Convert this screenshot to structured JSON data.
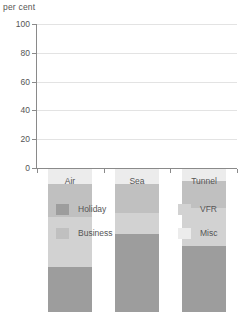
{
  "chart_data": {
    "type": "bar",
    "subtype": "stacked-bar",
    "title": "",
    "xlabel": "",
    "ylabel": "per cent",
    "ylim": [
      0,
      100
    ],
    "yticks": [
      0,
      20,
      40,
      60,
      80,
      100
    ],
    "grid": true,
    "legend_position": "bottom",
    "categories": [
      "Air",
      "Sea",
      "Tunnel"
    ],
    "series": [
      {
        "name": "Holiday",
        "color": "#9d9d9d",
        "values": [
          31,
          54,
          46
        ]
      },
      {
        "name": "VFR",
        "color": "#d2d2d2",
        "values": [
          35,
          15,
          26
        ]
      },
      {
        "name": "Business",
        "color": "#c0c0c0",
        "values": [
          23,
          20,
          19
        ]
      },
      {
        "name": "Misc",
        "color": "#ececec",
        "values": [
          11,
          11,
          9
        ]
      }
    ],
    "totals": [
      100,
      100,
      100
    ],
    "bar_tops": [
      89,
      89,
      91
    ]
  },
  "axis": {
    "y_title": "per cent",
    "y_ticks": [
      {
        "label": "100"
      },
      {
        "label": "80"
      },
      {
        "label": "60"
      },
      {
        "label": "40"
      },
      {
        "label": "20"
      },
      {
        "label": "0"
      }
    ],
    "x_ticks": [
      {
        "label": "Air"
      },
      {
        "label": "Sea"
      },
      {
        "label": "Tunnel"
      }
    ]
  },
  "legend": {
    "items": [
      {
        "label": "Holiday",
        "color": "#9d9d9d"
      },
      {
        "label": "VFR",
        "color": "#d2d2d2"
      },
      {
        "label": "Business",
        "color": "#c0c0c0"
      },
      {
        "label": "Misc",
        "color": "#ececec"
      }
    ]
  }
}
